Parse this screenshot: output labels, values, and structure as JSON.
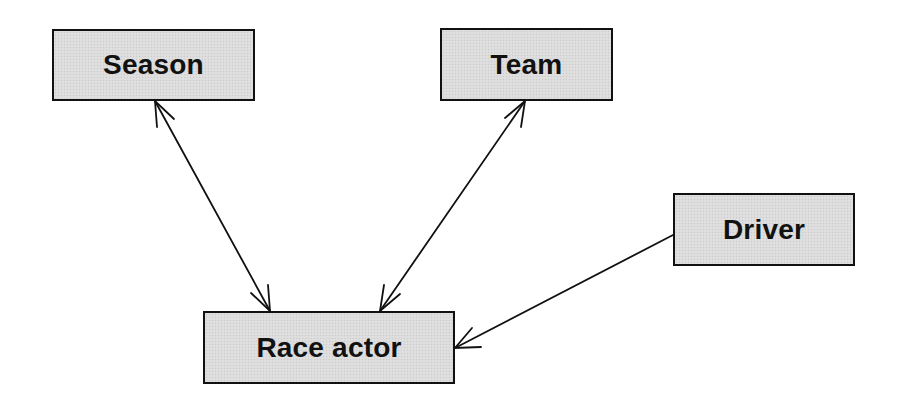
{
  "diagram": {
    "type": "entity-relationship",
    "nodes": [
      {
        "id": "season",
        "label": "Season"
      },
      {
        "id": "team",
        "label": "Team"
      },
      {
        "id": "driver",
        "label": "Driver"
      },
      {
        "id": "race_actor",
        "label": "Race actor"
      }
    ],
    "edges": [
      {
        "from": "season",
        "to": "race_actor",
        "direction": "bidirectional"
      },
      {
        "from": "team",
        "to": "race_actor",
        "direction": "bidirectional"
      },
      {
        "from": "driver",
        "to": "race_actor",
        "direction": "unidirectional"
      }
    ],
    "colors": {
      "node_fill": "#dcdcdc",
      "node_border": "#111111",
      "edge": "#111111",
      "background": "#ffffff"
    }
  }
}
